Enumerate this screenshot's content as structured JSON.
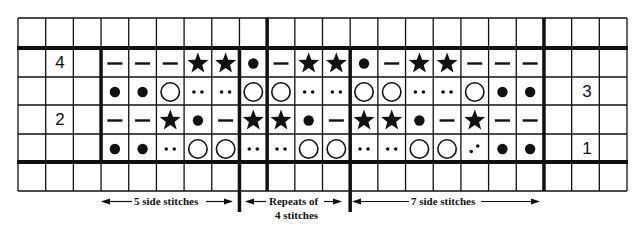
{
  "chart": {
    "columns": 22,
    "rows_visible": 6,
    "stitch_columns_start": 3,
    "stitch_columns_end": 18,
    "row_labels": [
      {
        "label": "4",
        "row": 1,
        "side": "left"
      },
      {
        "label": "3",
        "row": 2,
        "side": "right"
      },
      {
        "label": "2",
        "row": 3,
        "side": "left"
      },
      {
        "label": "1",
        "row": 4,
        "side": "right"
      }
    ],
    "symbol_rows": [
      {
        "row_number": "4",
        "symbols": [
          "dash",
          "dash",
          "dash",
          "star",
          "star",
          "dot",
          "dash",
          "star",
          "star",
          "dot",
          "dash",
          "star",
          "star",
          "dash",
          "dash",
          "dash"
        ]
      },
      {
        "row_number": "3",
        "symbols": [
          "dot",
          "dot",
          "circle",
          "twodots",
          "twodots",
          "circle",
          "circle",
          "twodots",
          "twodots",
          "circle",
          "circle",
          "twodots",
          "twodots",
          "circle",
          "dot",
          "dot"
        ]
      },
      {
        "row_number": "2",
        "symbols": [
          "dash",
          "dash",
          "star",
          "dot",
          "dash",
          "star",
          "star",
          "dot",
          "dash",
          "star",
          "star",
          "dot",
          "dash",
          "star",
          "dash",
          "dash"
        ]
      },
      {
        "row_number": "1",
        "symbols": [
          "dot",
          "dot",
          "twodots",
          "circle",
          "circle",
          "twodots",
          "twodots",
          "circle",
          "circle",
          "twodots",
          "twodots",
          "circle",
          "circle",
          "diagdots",
          "dot",
          "dot"
        ]
      }
    ],
    "symbol_legend": {
      "dash": "horizontal bar",
      "star": "filled star",
      "dot": "filled dot",
      "circle": "open circle",
      "twodots": "two small dots",
      "diagdots": "two diagonal dots"
    }
  },
  "captions": {
    "left": "5 side stitches",
    "middle_line1": "Repeats of",
    "middle_line2": "4 stitches",
    "right": "7 side stitches"
  },
  "colors": {
    "ink": "#111111",
    "background": "#ffffff"
  }
}
